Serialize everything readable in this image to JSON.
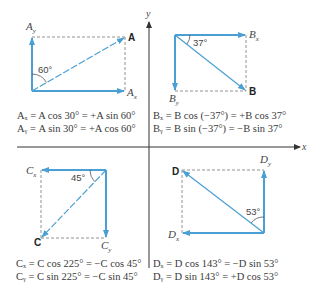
{
  "axes": {
    "x_label": "x",
    "y_label": "y"
  },
  "colors": {
    "vector": "#4a9fd4",
    "component": "#3b8fcf",
    "dashed": "#666666",
    "axis": "#333333"
  },
  "quadrants": [
    {
      "vector": "A",
      "angle_label": "60°",
      "x_comp": "A",
      "x_sub": "x",
      "y_comp": "A",
      "y_sub": "y",
      "eq_x": "Aₓ = A cos 30° = +A sin 60°",
      "eq_y": "Aᵧ = A sin 30° = +A cos 60°"
    },
    {
      "vector": "B",
      "angle_label": "37°",
      "x_comp": "B",
      "x_sub": "x",
      "y_comp": "B",
      "y_sub": "y",
      "eq_x": "Bₓ = B cos (−37°) = +B cos 37°",
      "eq_y": "Bᵧ = B sin (−37°) = −B sin 37°"
    },
    {
      "vector": "C",
      "angle_label": "45°",
      "x_comp": "C",
      "x_sub": "x",
      "y_comp": "C",
      "y_sub": "y",
      "eq_x": "Cₓ = C cos 225° = −C cos 45°",
      "eq_y": "Cᵧ = C sin 225° = −C sin 45°"
    },
    {
      "vector": "D",
      "angle_label": "53°",
      "x_comp": "D",
      "x_sub": "x",
      "y_comp": "D",
      "y_sub": "y",
      "eq_x": "Dₓ = D cos 143° = −D sin 53°",
      "eq_y": "Dᵧ = D sin 143° = +D cos 53°"
    }
  ]
}
